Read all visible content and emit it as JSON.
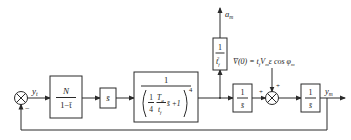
{
  "diagram": {
    "type": "control-block-diagram",
    "colors": {
      "line": "#2a2a2a",
      "background": "#ffffff",
      "text": "#222222"
    },
    "input_signal_label": "y",
    "input_signal_sub": "t",
    "feedback_sign": "−",
    "blocks": [
      {
        "id": "gain",
        "numerator": "N",
        "denominator": "1−t̄"
      },
      {
        "id": "s-bar",
        "text": "s̄"
      },
      {
        "id": "lag",
        "numerator": "1",
        "den_frac_num": "1",
        "den_frac_den": "4",
        "den_T": "T",
        "den_T_sub": "g",
        "den_t": "t",
        "den_t_sub": "f",
        "den_rest": "s̄ +1",
        "exponent": "4"
      },
      {
        "id": "accel-scale",
        "numerator": "1",
        "denominator": "t",
        "den_sub": "f",
        "den_sup": "2"
      },
      {
        "id": "integrator-1",
        "numerator": "1",
        "denominator": "s̄"
      },
      {
        "id": "integrator-2",
        "numerator": "1",
        "denominator": "s̄"
      }
    ],
    "accel_output_label": "a",
    "accel_output_sub": "m",
    "initial_condition": {
      "lhs": "V̄(0) = t",
      "lhs_sub": "f",
      "mid": "V",
      "mid_sub": "m",
      "rhs": "ε cos φ",
      "rhs_sub": "m"
    },
    "sum2_signs": {
      "left": "+",
      "top": "+"
    },
    "output_label": "y",
    "output_sub": "m"
  }
}
